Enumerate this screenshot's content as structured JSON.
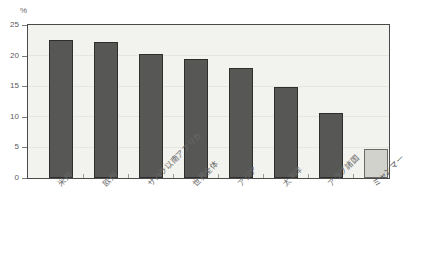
{
  "chart_data": {
    "type": "bar",
    "title": "",
    "xlabel": "",
    "ylabel": "%",
    "unit_label": "%",
    "ylim": [
      0,
      25
    ],
    "yticks": [
      0,
      5,
      10,
      15,
      20,
      25
    ],
    "ytick_labels": [
      "0",
      "5",
      "10",
      "15",
      "20",
      "25"
    ],
    "grid": true,
    "legend": "none",
    "categories": [
      "米州",
      "欧州",
      "サハラ以南アフリカ",
      "世界全体",
      "アジア",
      "太平洋",
      "アラブ諸国",
      "ミャンマー"
    ],
    "values": [
      22.7,
      22.3,
      20.3,
      19.5,
      18.0,
      15.0,
      10.7,
      4.7
    ],
    "bar_styles": [
      "dark",
      "dark",
      "dark",
      "dark",
      "dark",
      "dark",
      "dark",
      "light"
    ],
    "colors": {
      "bar_dark": "#575755",
      "bar_light": "#d2d2cc",
      "plot_background": "#f2f2ee",
      "axis": "#4a4a4a",
      "text": "#6b6b6b"
    }
  }
}
